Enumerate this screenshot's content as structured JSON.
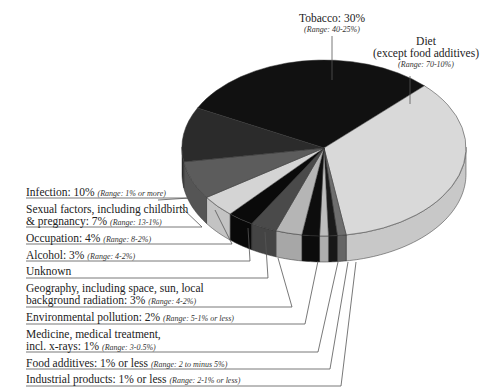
{
  "chart_data": {
    "type": "pie",
    "style": "3d-exploded-leader-lines",
    "title": "",
    "slices": [
      {
        "label": "Tobacco",
        "value": 30,
        "display": "Tobacco: 30%",
        "range": "(Range: 40-25%)",
        "color": "#111111"
      },
      {
        "label": "Diet (except food additives)",
        "value": 35,
        "display": "Diet",
        "display2": "(except food additives)",
        "range": "(Range: 70-10%)",
        "color": "#d9d9d9"
      },
      {
        "label": "Industrial products",
        "value": 1,
        "display": "Industrial products: 1% or less",
        "range": "(Range: 2-1% or less)",
        "color": "#6e6e6e"
      },
      {
        "label": "Food additives",
        "value": 1,
        "display": "Food additives: 1% or less",
        "range": "(Range: 2 to minus 5%)",
        "color": "#1a1a1a"
      },
      {
        "label": "Medicine, medical treatment, incl. x-rays",
        "value": 1,
        "display": "Medicine, medical treatment,",
        "display2": "incl. x-rays: 1%",
        "range": "(Range: 3-0.5%)",
        "color": "#bdbdbd"
      },
      {
        "label": "Environmental pollution",
        "value": 2,
        "display": "Environmental pollution: 2%",
        "range": "(Range: 5-1% or less)",
        "color": "#0d0d0d"
      },
      {
        "label": "Geography, including space, sun, local background radiation",
        "value": 3,
        "display": "Geography, including space, sun, local",
        "display2": "background radiation: 3%",
        "range": "(Range: 4-2%)",
        "color": "#b5b5b5"
      },
      {
        "label": "Unknown",
        "value": 3,
        "display": "Unknown",
        "range": "",
        "color": "#4a4a4a"
      },
      {
        "label": "Alcohol",
        "value": 3,
        "display": "Alcohol: 3%",
        "range": "(Range: 4-2%)",
        "color": "#0a0a0a"
      },
      {
        "label": "Occupation",
        "value": 4,
        "display": "Occupation: 4%",
        "range": "(Range: 8-2%)",
        "color": "#d4d4d4"
      },
      {
        "label": "Sexual factors, including childbirth & pregnancy",
        "value": 7,
        "display": "Sexual factors, including childbirth",
        "display2": "& pregnancy: 7%",
        "range": "(Range: 13-1%)",
        "color": "#5c5c5c"
      },
      {
        "label": "Infection",
        "value": 10,
        "display": "Infection: 10%",
        "range": "(Range: 1% or more)",
        "color": "#2b2b2b"
      }
    ],
    "legend": "none (leader-line labels)"
  }
}
